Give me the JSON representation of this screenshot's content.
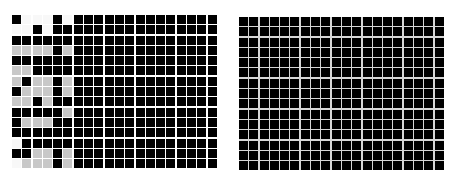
{
  "left_grid": {
    "origin": [
      12,
      15
    ],
    "columns": 20,
    "rows": 15,
    "colors": {
      "b": "#000000",
      "g": "#c8c8c8",
      "w": "#f8f8f8"
    },
    "pattern_left_columns": [
      "bwwwbw",
      "wwbwbb",
      "bbbbbb",
      "ggggbg",
      "bbbbbb",
      "ggbbbb",
      "gbggbg",
      "bgggbg",
      "ggbgbb",
      "bbbbbg",
      "bgggbb",
      "bbbbbb",
      "wbbbbb",
      "bbggbg",
      "wgggbg"
    ]
  },
  "right_grid": {
    "origin": [
      239,
      17
    ],
    "columns": 20,
    "rows": 15,
    "cell_color": "#000000",
    "line_color": "#d8d8d8"
  }
}
